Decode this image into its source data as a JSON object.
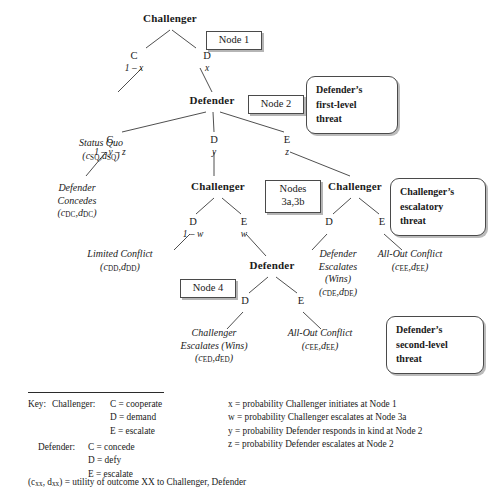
{
  "figure": {
    "type": "extensive-form-game-tree",
    "title": ""
  },
  "tree": {
    "nodes": [
      {
        "id": "n1",
        "player": "Challenger",
        "x": 170,
        "y": 18
      },
      {
        "id": "n2",
        "player": "Defender",
        "x": 212,
        "y": 100
      },
      {
        "id": "n3a",
        "player": "Challenger",
        "x": 218,
        "y": 186
      },
      {
        "id": "n3b",
        "player": "Challenger",
        "x": 355,
        "y": 186
      },
      {
        "id": "n4",
        "player": "Defender",
        "x": 272,
        "y": 265
      }
    ],
    "branches": [
      {
        "from": "n1",
        "action": "C",
        "prob": "1 – x",
        "ax": 134,
        "ay": 55
      },
      {
        "from": "n1",
        "action": "D",
        "prob": "x",
        "ax": 207,
        "ay": 55
      },
      {
        "from": "n2",
        "action": "C",
        "prob": "1 – y – z",
        "ax": 110,
        "ay": 140
      },
      {
        "from": "n2",
        "action": "D",
        "prob": "y",
        "ax": 214,
        "ay": 140
      },
      {
        "from": "n2",
        "action": "E",
        "prob": "z",
        "ax": 287,
        "ay": 140
      },
      {
        "from": "n3a",
        "action": "D",
        "prob": "1 – w",
        "ax": 192,
        "ay": 222
      },
      {
        "from": "n3a",
        "action": "E",
        "prob": "w",
        "ax": 244,
        "ay": 222
      },
      {
        "from": "n3b",
        "action": "D",
        "prob": "",
        "ax": 329,
        "ay": 222
      },
      {
        "from": "n3b",
        "action": "E",
        "prob": "",
        "ax": 382,
        "ay": 222
      },
      {
        "from": "n4",
        "action": "D",
        "prob": "",
        "ax": 245,
        "ay": 300
      },
      {
        "from": "n4",
        "action": "E",
        "prob": "",
        "ax": 301,
        "ay": 300
      }
    ],
    "outcomes": [
      {
        "id": "o_sq",
        "label": "Status Quo",
        "c": "SQ",
        "d": "SQ",
        "x": 100,
        "y": 143
      },
      {
        "id": "o_dc",
        "label": "Defender\nConcedes",
        "c": "DC",
        "d": "DC",
        "x": 72,
        "y": 188
      },
      {
        "id": "o_dd",
        "label": "Limited Conflict",
        "c": "DD",
        "d": "DD",
        "x": 120,
        "y": 253
      },
      {
        "id": "o_de",
        "label": "Defender\nEscalates\n(Wins)",
        "c": "DE",
        "d": "DE",
        "x": 338,
        "y": 253
      },
      {
        "id": "o_ee1",
        "label": "All-Out Conflict",
        "c": "EE",
        "d": "EE",
        "x": 410,
        "y": 253
      },
      {
        "id": "o_ed",
        "label": "Challenger\nEscalates (Wins)",
        "c": "ED",
        "d": "ED",
        "x": 212,
        "y": 332
      },
      {
        "id": "o_ee2",
        "label": "All-Out Conflict",
        "c": "EE",
        "d": "EE",
        "x": 320,
        "y": 332
      }
    ]
  },
  "node_labels": [
    {
      "id": "node1",
      "text": "Node 1",
      "x": 206,
      "y": 31,
      "w": 56,
      "h": 19
    },
    {
      "id": "node2",
      "text": "Node 2",
      "x": 248,
      "y": 95,
      "w": 56,
      "h": 19
    },
    {
      "id": "nodes3",
      "line1": "Nodes",
      "line2": "3a,3b",
      "x": 265,
      "y": 180,
      "w": 56,
      "h": 33
    },
    {
      "id": "node4",
      "text": "Node 4",
      "x": 180,
      "y": 279,
      "w": 56,
      "h": 19
    }
  ],
  "threats": [
    {
      "id": "defender-first-level",
      "lines": [
        "Defender’s",
        "first-level",
        "threat"
      ],
      "x": 306,
      "y": 76,
      "w": 92,
      "h": 58
    },
    {
      "id": "challenger-escalatory",
      "lines": [
        "Challenger’s",
        "escalatory",
        "threat"
      ],
      "x": 390,
      "y": 178,
      "w": 96,
      "h": 58
    },
    {
      "id": "defender-second-level",
      "lines": [
        "Defender’s",
        "second-level",
        "threat"
      ],
      "x": 386,
      "y": 316,
      "w": 98,
      "h": 58
    }
  ],
  "legend": {
    "key_label": "Key:",
    "players": [
      {
        "name": "Challenger:",
        "entries": [
          "C = cooperate",
          "D = demand",
          "E = escalate"
        ]
      },
      {
        "name": "Defender:",
        "entries": [
          "C = concede",
          "D = defy",
          "E = escalate"
        ]
      }
    ],
    "probabilities": [
      "x  = probability Challenger initiates at Node 1",
      "w = probability Challenger escalates at Node 3a",
      "y  = probability Defender responds in kind at Node 2",
      "z  = probability Defender escalates at Node 2"
    ],
    "utility_note": {
      "prefix": "(c",
      "sub1": "xx",
      "mid": ", d",
      "sub2": "xx",
      "suffix": ") = utility of outcome XX to Challenger, Defender"
    }
  },
  "colors": {
    "ink": "#1a1a1a",
    "line": "#3b3b3b",
    "box_border": "#4a4a4a",
    "background": "#ffffff"
  }
}
